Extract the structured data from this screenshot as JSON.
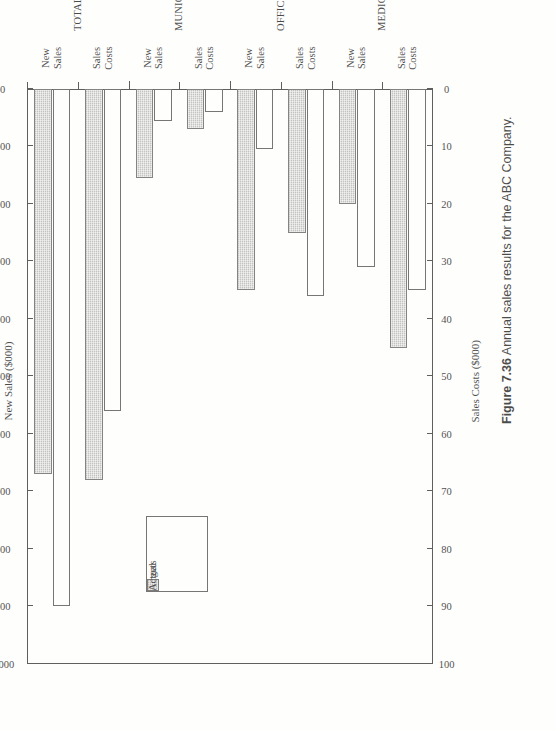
{
  "figure": {
    "number": "Figure 7.36",
    "caption": "Annual sales results for the ABC Company."
  },
  "legend": {
    "position": "upper-left-inside",
    "entries": [
      {
        "label": "Targets",
        "swatch": "open-white-square"
      },
      {
        "label": "Actual",
        "swatch": "gray-hatched-square"
      }
    ]
  },
  "axes": {
    "new_sales": {
      "title": "New Sales ($000)",
      "ticks": [
        "1,000",
        "900",
        "800",
        "700",
        "600",
        "500",
        "400",
        "300",
        "200",
        "100",
        "0"
      ],
      "min": 0,
      "max": 1000
    },
    "sales_costs": {
      "title": "Sales Costs ($000)",
      "ticks": [
        "100",
        "90",
        "80",
        "70",
        "60",
        "50",
        "40",
        "30",
        "20",
        "10",
        "0"
      ],
      "min": 0,
      "max": 100
    }
  },
  "chart_data": {
    "type": "bar",
    "title": "Annual sales results for the ABC Company.",
    "orientation": "horizontal-paired-grouped",
    "xlabel": "",
    "ylabel": "",
    "grid": false,
    "legend_position": "upper left",
    "value_axes": [
      {
        "name": "New Sales ($000)",
        "applies_to": "New Sales",
        "range": [
          0,
          1000
        ],
        "ticks": [
          0,
          100,
          200,
          300,
          400,
          500,
          600,
          700,
          800,
          900,
          1000
        ]
      },
      {
        "name": "Sales Costs ($000)",
        "applies_to": "Sales Costs",
        "range": [
          0,
          100
        ],
        "ticks": [
          0,
          10,
          20,
          30,
          40,
          50,
          60,
          70,
          80,
          90,
          100
        ]
      }
    ],
    "series": [
      {
        "name": "Targets",
        "style": "open-white"
      },
      {
        "name": "Actual",
        "style": "gray-hatched"
      }
    ],
    "groups": [
      {
        "group": "MEDICAL FACILITIES",
        "measures": [
          {
            "category": "Sales Costs",
            "unit": "$000",
            "axis": "Sales Costs ($000)",
            "Targets": 35,
            "Actual": 45
          },
          {
            "category": "New Sales",
            "unit": "$000",
            "axis": "New Sales ($000)",
            "Targets": 310,
            "Actual": 200
          }
        ]
      },
      {
        "group": "OFFICE BUILDINGS",
        "measures": [
          {
            "category": "Sales Costs",
            "unit": "$000",
            "axis": "Sales Costs ($000)",
            "Targets": 36,
            "Actual": 25
          },
          {
            "category": "New Sales",
            "unit": "$000",
            "axis": "New Sales ($000)",
            "Targets": 105,
            "Actual": 350
          }
        ]
      },
      {
        "group": "MUNICIPAL BUILDINGS",
        "measures": [
          {
            "category": "Sales Costs",
            "unit": "$000",
            "axis": "Sales Costs ($000)",
            "Targets": 4,
            "Actual": 7
          },
          {
            "category": "New Sales",
            "unit": "$000",
            "axis": "New Sales ($000)",
            "Targets": 55,
            "Actual": 155
          }
        ]
      },
      {
        "group": "TOTALS",
        "measures": [
          {
            "category": "Sales Costs",
            "unit": "$000",
            "axis": "Sales Costs ($000)",
            "Targets": 56,
            "Actual": 68
          },
          {
            "category": "New Sales",
            "unit": "$000",
            "axis": "New Sales ($000)",
            "Targets": 900,
            "Actual": 670
          }
        ]
      }
    ]
  }
}
